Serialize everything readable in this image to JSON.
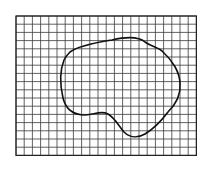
{
  "diagram": {
    "description": "Irregular closed outline drawn on square grid paper (area estimation by counting squares)",
    "grid": {
      "columns": 22,
      "rows": 17,
      "left": 16,
      "top": 16,
      "cell_size": 8.2,
      "line_color": "#3a3a3a",
      "border_color": "#222222"
    },
    "shape": {
      "type": "closed-curve",
      "stroke_color": "#111111"
    }
  }
}
